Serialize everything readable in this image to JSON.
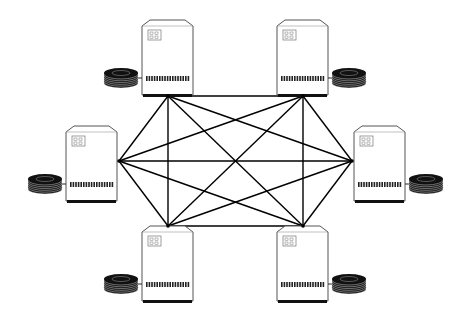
{
  "diagram": {
    "title": "",
    "type": "fully-connected network",
    "nodes": [
      {
        "id": "n1",
        "label": "",
        "position": "top-left",
        "kind": "server",
        "disk_side": "left"
      },
      {
        "id": "n2",
        "label": "",
        "position": "top-right",
        "kind": "server",
        "disk_side": "right"
      },
      {
        "id": "n3",
        "label": "",
        "position": "middle-left",
        "kind": "server",
        "disk_side": "left"
      },
      {
        "id": "n4",
        "label": "",
        "position": "middle-right",
        "kind": "server",
        "disk_side": "right"
      },
      {
        "id": "n5",
        "label": "",
        "position": "bottom-left",
        "kind": "server",
        "disk_side": "left"
      },
      {
        "id": "n6",
        "label": "",
        "position": "bottom-right",
        "kind": "server",
        "disk_side": "right"
      }
    ],
    "edges": [
      [
        "n1",
        "n2"
      ],
      [
        "n1",
        "n3"
      ],
      [
        "n1",
        "n4"
      ],
      [
        "n1",
        "n5"
      ],
      [
        "n1",
        "n6"
      ],
      [
        "n2",
        "n3"
      ],
      [
        "n2",
        "n4"
      ],
      [
        "n2",
        "n5"
      ],
      [
        "n2",
        "n6"
      ],
      [
        "n3",
        "n4"
      ],
      [
        "n3",
        "n5"
      ],
      [
        "n3",
        "n6"
      ],
      [
        "n4",
        "n5"
      ],
      [
        "n4",
        "n6"
      ],
      [
        "n5",
        "n6"
      ]
    ],
    "colors": {
      "line": "#000000",
      "fill": "#ffffff",
      "outline": "#555555"
    }
  }
}
